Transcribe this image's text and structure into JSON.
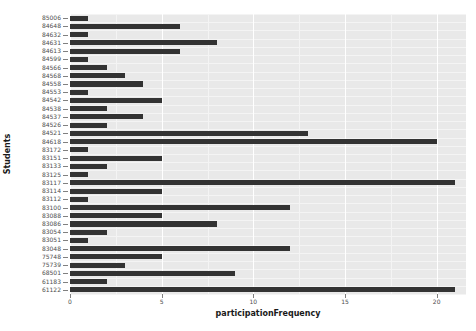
{
  "chart_data": {
    "type": "bar",
    "orientation": "horizontal",
    "title": "",
    "xlabel": "participationFrequency",
    "ylabel": "Students",
    "xlim": [
      0,
      21.6
    ],
    "ylim": [
      0,
      33
    ],
    "grid": true,
    "legend": null,
    "bar_color": "#333333",
    "panel_color": "#e9e9e9",
    "x_ticks": [
      0,
      5,
      10,
      15,
      20
    ],
    "x_tick_labels": [
      "0",
      "5",
      "10",
      "15",
      "20"
    ],
    "x_minor_ticks": [
      2.5,
      7.5,
      12.5,
      17.5
    ],
    "categories": [
      "85006",
      "84648",
      "84632",
      "84631",
      "84613",
      "84599",
      "84566",
      "84568",
      "84558",
      "84553",
      "84542",
      "84538",
      "84537",
      "84526",
      "84521",
      "84618",
      "83172",
      "83151",
      "83133",
      "83125",
      "83117",
      "83114",
      "83112",
      "83100",
      "83088",
      "83086",
      "83054",
      "83051",
      "83048",
      "75748",
      "75739",
      "68501",
      "61183",
      "61122"
    ],
    "values": [
      1,
      6,
      1,
      8,
      6,
      1,
      2,
      3,
      4,
      1,
      5,
      2,
      4,
      2,
      13,
      20,
      1,
      5,
      2,
      1,
      21,
      5,
      1,
      12,
      5,
      8,
      2,
      1,
      12,
      5,
      3,
      9,
      2,
      21
    ]
  }
}
